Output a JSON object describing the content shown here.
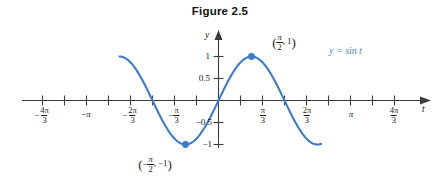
{
  "figure": {
    "title": "Figure 2.5",
    "curve_label": "y = sin t",
    "axis_x_name": "t",
    "axis_y_name": "y",
    "accent_color": "#3d7cc9",
    "label_color": "#4a86c8"
  },
  "x_ticks": [
    {
      "label": "-4π/3",
      "num": "4π",
      "den": "3",
      "sign": "−",
      "value": -4.18879
    },
    {
      "label": "-π",
      "plain": "−π",
      "value": -3.14159
    },
    {
      "label": "-2π/3",
      "num": "2π",
      "den": "3",
      "sign": "−",
      "value": -2.0944
    },
    {
      "label": "-π/3",
      "num": "π",
      "den": "3",
      "sign": "−",
      "value": -1.0472
    },
    {
      "label": "π/3",
      "num": "π",
      "den": "3",
      "sign": "",
      "value": 1.0472
    },
    {
      "label": "2π/3",
      "num": "2π",
      "den": "3",
      "sign": "",
      "value": 2.0944
    },
    {
      "label": "π",
      "plain": "π",
      "value": 3.14159
    },
    {
      "label": "4π/3",
      "num": "4π",
      "den": "3",
      "sign": "",
      "value": 4.18879
    }
  ],
  "y_ticks": [
    {
      "label": "1",
      "value": 1
    },
    {
      "label": "0.5",
      "value": 0.5
    },
    {
      "label": "-0.5",
      "value": -0.5
    },
    {
      "label": "-1",
      "value": -1
    }
  ],
  "points": [
    {
      "name": "maximum",
      "label_open": "(",
      "label_close": ")",
      "num": "π",
      "den": "2",
      "sign": "",
      "y_text": ", 1",
      "x": 1.5708,
      "y": 1
    },
    {
      "name": "minimum",
      "label_open": "(",
      "label_close": ")",
      "num": "π",
      "den": "2",
      "sign": "−",
      "y_text": ", −1",
      "x": -1.5708,
      "y": -1
    }
  ],
  "chart_data": {
    "type": "line",
    "title": "Figure 2.5",
    "xlabel": "t",
    "ylabel": "y",
    "grid": false,
    "legend_position": "inline-right",
    "series": [
      {
        "name": "y = sin t",
        "color": "#3d7cc9",
        "function": "sin(t)",
        "xlim": [
          -4.71239,
          4.88692
        ],
        "x": [
          -4.71239,
          -4.18879,
          -3.66519,
          -3.14159,
          -2.61799,
          -2.0944,
          -1.5708,
          -1.0472,
          -0.5236,
          0,
          0.5236,
          1.0472,
          1.5708,
          2.0944,
          2.61799,
          3.14159,
          3.66519,
          4.18879,
          4.71239,
          4.88692
        ],
        "y": [
          1,
          0.866,
          0.5,
          0,
          -0.5,
          -0.866,
          -1,
          -0.866,
          -0.5,
          0,
          0.5,
          0.866,
          1,
          0.866,
          0.5,
          0,
          -0.5,
          -0.866,
          -1,
          -0.985
        ]
      }
    ],
    "xtick_labels": [
      "-4π/3",
      "-π",
      "-2π/3",
      "-π/3",
      "π/3",
      "2π/3",
      "π",
      "4π/3"
    ],
    "xtick_values": [
      -4.18879,
      -3.14159,
      -2.0944,
      -1.0472,
      1.0472,
      2.0944,
      3.14159,
      4.18879
    ],
    "ytick_labels": [
      "1",
      "0.5",
      "-0.5",
      "-1"
    ],
    "ytick_values": [
      1,
      0.5,
      -0.5,
      -1
    ],
    "ylim": [
      -1.15,
      1.15
    ],
    "annotations": [
      {
        "text": "(π/2, 1)",
        "x": 1.5708,
        "y": 1
      },
      {
        "text": "(−π/2, −1)",
        "x": -1.5708,
        "y": -1
      },
      {
        "text": "y = sin t",
        "x": 3.6,
        "y": 0.78
      }
    ]
  }
}
